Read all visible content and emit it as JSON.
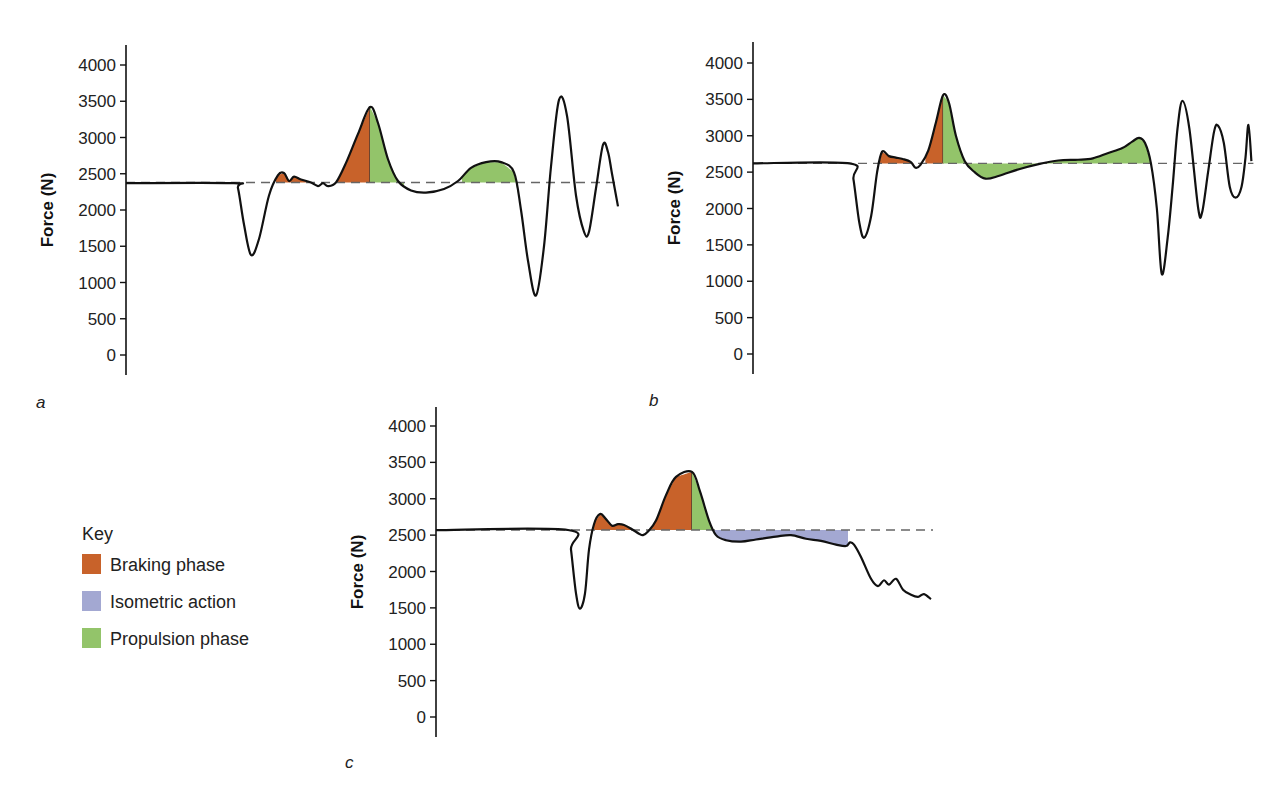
{
  "colors": {
    "braking": "#c8622a",
    "isometric": "#a3a8d2",
    "propulsion": "#93c46a",
    "line": "#111111",
    "baseline": "#666666"
  },
  "key": {
    "title": "Key",
    "items": [
      {
        "label": "Braking phase",
        "color": "#c8622a"
      },
      {
        "label": "Isometric action",
        "color": "#a3a8d2"
      },
      {
        "label": "Propulsion phase",
        "color": "#93c46a"
      }
    ]
  },
  "chart_data": [
    {
      "panel": "a",
      "type": "line",
      "ylabel": "Force (N)",
      "xlabel": "",
      "ylim": [
        -300,
        4300
      ],
      "yticks": [
        0,
        500,
        1000,
        1500,
        2000,
        2500,
        3000,
        3500,
        4000
      ],
      "grid": false,
      "baseline_force": 2380,
      "points_t_force": [
        [
          0,
          2370
        ],
        [
          108,
          2370
        ],
        [
          112,
          2300
        ],
        [
          118,
          1800
        ],
        [
          125,
          1380
        ],
        [
          133,
          1600
        ],
        [
          143,
          2200
        ],
        [
          152,
          2480
        ],
        [
          158,
          2510
        ],
        [
          163,
          2400
        ],
        [
          168,
          2460
        ],
        [
          175,
          2420
        ],
        [
          185,
          2380
        ],
        [
          192,
          2330
        ],
        [
          197,
          2370
        ],
        [
          202,
          2330
        ],
        [
          210,
          2380
        ],
        [
          220,
          2650
        ],
        [
          232,
          3050
        ],
        [
          244,
          3420
        ],
        [
          252,
          3200
        ],
        [
          262,
          2700
        ],
        [
          272,
          2400
        ],
        [
          285,
          2270
        ],
        [
          300,
          2240
        ],
        [
          318,
          2290
        ],
        [
          332,
          2400
        ],
        [
          345,
          2580
        ],
        [
          360,
          2660
        ],
        [
          375,
          2660
        ],
        [
          388,
          2520
        ],
        [
          395,
          2000
        ],
        [
          402,
          1300
        ],
        [
          410,
          820
        ],
        [
          418,
          1500
        ],
        [
          425,
          2600
        ],
        [
          433,
          3520
        ],
        [
          441,
          3300
        ],
        [
          450,
          2200
        ],
        [
          458,
          1700
        ],
        [
          463,
          1700
        ],
        [
          470,
          2300
        ],
        [
          477,
          2900
        ],
        [
          482,
          2800
        ],
        [
          486,
          2500
        ],
        [
          492,
          2050
        ]
      ],
      "shaded": [
        {
          "phase": "braking",
          "from_t": 150,
          "to_t": 180
        },
        {
          "phase": "braking",
          "from_t": 210,
          "to_t": 244
        },
        {
          "phase": "propulsion",
          "from_t": 244,
          "to_t": 278
        },
        {
          "phase": "propulsion",
          "from_t": 336,
          "to_t": 392
        }
      ],
      "annotations": {
        "peak_braking_propulsion_N": 3420,
        "min_unweighting_N": 1380
      }
    },
    {
      "panel": "b",
      "type": "line",
      "ylabel": "Force (N)",
      "xlabel": "",
      "ylim": [
        -300,
        4300
      ],
      "yticks": [
        0,
        500,
        1000,
        1500,
        2000,
        2500,
        3000,
        3500,
        4000
      ],
      "grid": false,
      "baseline_force": 2620,
      "points_t_force": [
        [
          0,
          2620
        ],
        [
          98,
          2620
        ],
        [
          102,
          2400
        ],
        [
          108,
          1800
        ],
        [
          113,
          1600
        ],
        [
          120,
          1900
        ],
        [
          126,
          2500
        ],
        [
          131,
          2780
        ],
        [
          138,
          2720
        ],
        [
          145,
          2700
        ],
        [
          152,
          2680
        ],
        [
          160,
          2640
        ],
        [
          165,
          2560
        ],
        [
          170,
          2600
        ],
        [
          178,
          2800
        ],
        [
          186,
          3200
        ],
        [
          193,
          3560
        ],
        [
          199,
          3450
        ],
        [
          206,
          3000
        ],
        [
          215,
          2650
        ],
        [
          225,
          2500
        ],
        [
          236,
          2410
        ],
        [
          250,
          2450
        ],
        [
          270,
          2540
        ],
        [
          290,
          2610
        ],
        [
          310,
          2660
        ],
        [
          330,
          2670
        ],
        [
          345,
          2690
        ],
        [
          360,
          2760
        ],
        [
          375,
          2830
        ],
        [
          385,
          2920
        ],
        [
          392,
          2970
        ],
        [
          398,
          2900
        ],
        [
          404,
          2620
        ],
        [
          410,
          2000
        ],
        [
          415,
          1100
        ],
        [
          421,
          1600
        ],
        [
          426,
          2300
        ],
        [
          431,
          3100
        ],
        [
          436,
          3480
        ],
        [
          443,
          3100
        ],
        [
          452,
          2000
        ],
        [
          456,
          1950
        ],
        [
          462,
          2500
        ],
        [
          468,
          3050
        ],
        [
          472,
          3140
        ],
        [
          478,
          2900
        ],
        [
          484,
          2300
        ],
        [
          490,
          2150
        ],
        [
          496,
          2300
        ],
        [
          500,
          2700
        ],
        [
          503,
          3150
        ],
        [
          506,
          2650
        ]
      ],
      "shaded": [
        {
          "phase": "braking",
          "from_t": 127,
          "to_t": 163
        },
        {
          "phase": "braking",
          "from_t": 175,
          "to_t": 193
        },
        {
          "phase": "propulsion",
          "from_t": 193,
          "to_t": 404
        }
      ],
      "annotations": {
        "peak_braking_propulsion_N": 3560,
        "min_unweighting_N": 1590
      }
    },
    {
      "panel": "c",
      "type": "line",
      "ylabel": "Force (N)",
      "xlabel": "",
      "ylim": [
        -300,
        4300
      ],
      "yticks": [
        0,
        500,
        1000,
        1500,
        2000,
        2500,
        3000,
        3500,
        4000
      ],
      "grid": false,
      "baseline_force": 2570,
      "points_t_force": [
        [
          0,
          2570
        ],
        [
          132,
          2570
        ],
        [
          135,
          2300
        ],
        [
          140,
          1700
        ],
        [
          144,
          1490
        ],
        [
          149,
          1700
        ],
        [
          153,
          2300
        ],
        [
          158,
          2650
        ],
        [
          164,
          2790
        ],
        [
          170,
          2720
        ],
        [
          176,
          2630
        ],
        [
          182,
          2650
        ],
        [
          188,
          2640
        ],
        [
          196,
          2580
        ],
        [
          203,
          2520
        ],
        [
          207,
          2500
        ],
        [
          212,
          2550
        ],
        [
          220,
          2700
        ],
        [
          230,
          3050
        ],
        [
          240,
          3300
        ],
        [
          256,
          3370
        ],
        [
          264,
          3100
        ],
        [
          273,
          2700
        ],
        [
          280,
          2500
        ],
        [
          290,
          2430
        ],
        [
          305,
          2410
        ],
        [
          320,
          2440
        ],
        [
          340,
          2480
        ],
        [
          355,
          2500
        ],
        [
          370,
          2450
        ],
        [
          385,
          2420
        ],
        [
          400,
          2370
        ],
        [
          410,
          2350
        ],
        [
          414,
          2400
        ],
        [
          418,
          2370
        ],
        [
          425,
          2200
        ],
        [
          435,
          1900
        ],
        [
          442,
          1800
        ],
        [
          448,
          1880
        ],
        [
          453,
          1820
        ],
        [
          460,
          1900
        ],
        [
          467,
          1750
        ],
        [
          475,
          1680
        ],
        [
          482,
          1650
        ],
        [
          488,
          1690
        ],
        [
          495,
          1620
        ]
      ],
      "shaded": [
        {
          "phase": "braking",
          "from_t": 155,
          "to_t": 196
        },
        {
          "phase": "braking",
          "from_t": 214,
          "to_t": 256
        },
        {
          "phase": "propulsion",
          "from_t": 256,
          "to_t": 277
        },
        {
          "phase": "isometric",
          "from_t": 277,
          "to_t": 412
        }
      ],
      "annotations": {
        "peak_braking_propulsion_N": 3370,
        "min_unweighting_N": 1490
      }
    }
  ]
}
